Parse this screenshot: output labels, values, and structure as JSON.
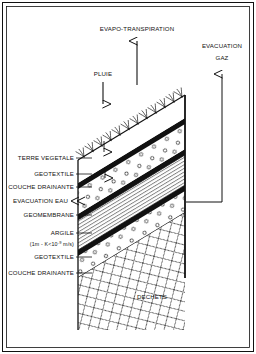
{
  "figure": {
    "type": "cross-section-diagram",
    "background_color": "#ffffff",
    "line_color": "#111111",
    "border": {
      "outer": true,
      "inner": true
    }
  },
  "flux_labels": {
    "evapotranspiration": "EVAPO-TRANSPIRATION",
    "rain": "PLUIE",
    "gas_line1": "EVACUATION",
    "gas_line2": "GAZ",
    "water": "EVACUATION EAU"
  },
  "layers": [
    {
      "id": "terre-vegetale",
      "label": "TERRE VEGETALE",
      "pattern": "blank"
    },
    {
      "id": "geotextile-upper",
      "label": "GEOTEXTILE",
      "pattern": "thick-line"
    },
    {
      "id": "couche-drainante-up",
      "label": "COUCHE DRAINANTE",
      "pattern": "circles"
    },
    {
      "id": "geomembrane",
      "label": "GEOMEMBRANE",
      "pattern": "thick-line"
    },
    {
      "id": "argile",
      "label": "ARGILE",
      "pattern": "hatch-lines"
    },
    {
      "id": "geotextile-lower",
      "label": "GEOTEXTILE",
      "pattern": "thick-line"
    },
    {
      "id": "couche-drainante-lo",
      "label": "COUCHE DRAINANTE",
      "pattern": "circles"
    },
    {
      "id": "dechets",
      "label": "DECHETS",
      "pattern": "cross-hatch"
    }
  ],
  "argile_spec": {
    "prefix": "(1m  -  K<10",
    "exponent": "-9",
    "suffix": " m/s)"
  },
  "waste_label": "DECHETS"
}
